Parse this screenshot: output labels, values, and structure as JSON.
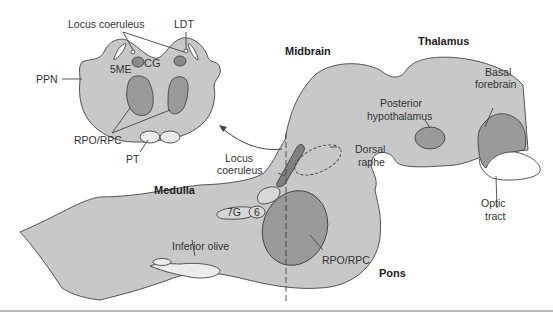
{
  "colors": {
    "tissue": "#c8c8c8",
    "nucleus": "#9a9a9a",
    "light_structure": "#ececec",
    "outline": "#444444",
    "background": "#ffffff"
  },
  "cross_section": {
    "labels": {
      "locus_coeruleus": "Locus coeruleus",
      "ldt": "LDT",
      "ppn": "PPN",
      "fivem": "5ME",
      "cg": "CG",
      "rpo_rpc": "RPO/RPC",
      "pt": "PT"
    }
  },
  "sagittal": {
    "regions": {
      "midbrain": "Midbrain",
      "thalamus": "Thalamus",
      "medulla": "Medulla",
      "pons": "Pons"
    },
    "labels": {
      "basal_forebrain_1": "Basal",
      "basal_forebrain_2": "forebrain",
      "posterior_hypothalamus_1": "Posterior",
      "posterior_hypothalamus_2": "hypothalamus",
      "dorsal_raphe_1": "Dorsal",
      "dorsal_raphe_2": "raphe",
      "locus_coeruleus_1": "Locus",
      "locus_coeruleus_2": "coeruleus",
      "optic_tract_1": "Optic",
      "optic_tract_2": "tract",
      "seven_g": "7G",
      "six": "6",
      "inferior_olive": "Inferior olive",
      "rpo_rpc": "RPO/RPC"
    }
  }
}
